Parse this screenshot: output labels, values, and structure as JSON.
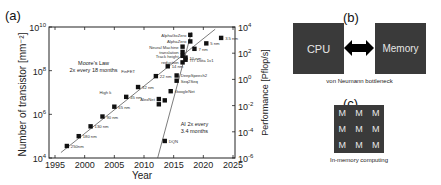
{
  "panels": {
    "a": {
      "label": "(a)"
    },
    "b": {
      "label": "(b)",
      "cpu": "CPU",
      "memory": "Memory",
      "caption": "von Neumann bottleneck"
    },
    "c": {
      "label": "(c)",
      "cell": "M",
      "cells": [
        "M",
        "M",
        "M",
        "M",
        "M",
        "M",
        "M",
        "M",
        "M"
      ],
      "caption": "In-memory computing"
    }
  },
  "chart_data": {
    "type": "scatter",
    "title": "",
    "xlabel": "Year",
    "ylabel_left": "Number of transistor [mm⁻²]",
    "ylabel_right": "Performance [Pflop/s]",
    "xlim": [
      1995,
      2025
    ],
    "xticks": [
      1995,
      2000,
      2005,
      2010,
      2015,
      2020,
      2025
    ],
    "ylim_left_log10": [
      4,
      10
    ],
    "yticks_left": [
      "10^4",
      "10^6",
      "10^8",
      "10^10"
    ],
    "ylim_right_log10": [
      -6,
      4
    ],
    "yticks_right": [
      "10^-6",
      "10^-4",
      "10^-2",
      "10^0",
      "10^2",
      "10^4"
    ],
    "annotations": [
      {
        "text": "Moore's Law",
        "x": 2001.5,
        "y_left_log": 8.25
      },
      {
        "text": "2x every 18 months",
        "x": 2001.5,
        "y_left_log": 7.95
      },
      {
        "text": "AI 2x every",
        "x": 2018.5,
        "y_left_log": 5.45
      },
      {
        "text": "3.4 months",
        "x": 2018.5,
        "y_left_log": 5.15
      }
    ],
    "series": [
      {
        "name": "Moore's Law (transistor density)",
        "axis": "left",
        "points": [
          {
            "label": "250nm",
            "x": 1997,
            "y_log": 4.55
          },
          {
            "label": "180 nm",
            "x": 1999,
            "y_log": 5.0
          },
          {
            "label": "130 nm",
            "x": 2001,
            "y_log": 5.45
          },
          {
            "label": "90 nm",
            "x": 2003,
            "y_log": 5.9
          },
          {
            "label": "65 nm",
            "x": 2005,
            "y_log": 6.35
          },
          {
            "label": "45 nm",
            "x": 2007,
            "y_log": 6.8
          },
          {
            "label": "32 nm",
            "x": 2009,
            "y_log": 7.25
          },
          {
            "label": "22 nm",
            "x": 2012,
            "y_log": 7.75
          },
          {
            "label": "14 nm",
            "x": 2014,
            "y_log": 8.2
          },
          {
            "label": "10 nm",
            "x": 2017,
            "y_log": 8.6
          },
          {
            "label": "7 nm",
            "x": 2018.5,
            "y_log": 9.0
          },
          {
            "label": "5 nm",
            "x": 2020.5,
            "y_log": 9.25
          },
          {
            "label": "3.5 nm",
            "x": 2023,
            "y_log": 9.5
          }
        ],
        "trendline": {
          "x": [
            1996,
            2022
          ],
          "y_log": [
            4.25,
            9.9
          ]
        },
        "side_labels": [
          {
            "text": "High k",
            "x": 2005.5,
            "y_log": 6.95
          },
          {
            "text": "FinFET",
            "x": 2009.5,
            "y_log": 7.9
          }
        ]
      },
      {
        "name": "AI compute",
        "axis": "right",
        "points": [
          {
            "label": "DQN",
            "x": 2013.5,
            "y_log": -4.7
          },
          {
            "label": "AlexNet",
            "x": 2012.5,
            "y_log": -1.5
          },
          {
            "label": "",
            "x": 2012.5,
            "y_log": -1.9
          },
          {
            "label": "",
            "x": 2013.5,
            "y_log": -1.6
          },
          {
            "label": "GoogleNet",
            "x": 2014.5,
            "y_log": -0.9
          },
          {
            "label": "DeepSpeech2",
            "x": 2015.5,
            "y_log": 0.3
          },
          {
            "label": "Seq2Seq",
            "x": 2015.5,
            "y_log": -0.1
          },
          {
            "label": "TI7 Dota 1v1",
            "x": 2017,
            "y_log": 1.5
          },
          {
            "label": "reduction",
            "x": 2016.5,
            "y_log": 1.3
          },
          {
            "label": "Track height",
            "x": 2016.5,
            "y_log": 1.8
          },
          {
            "label": "translation",
            "x": 2016.5,
            "y_log": 2.1
          },
          {
            "label": "Neural Machine",
            "x": 2016.5,
            "y_log": 2.5
          },
          {
            "label": "AlphaZero",
            "x": 2017.8,
            "y_log": 2.9
          },
          {
            "label": "AlphaGoZero",
            "x": 2017.8,
            "y_log": 3.4
          }
        ],
        "trendline": {
          "x": [
            2012.3,
            2018
          ],
          "y_log": [
            -6,
            3.6
          ]
        }
      }
    ]
  }
}
